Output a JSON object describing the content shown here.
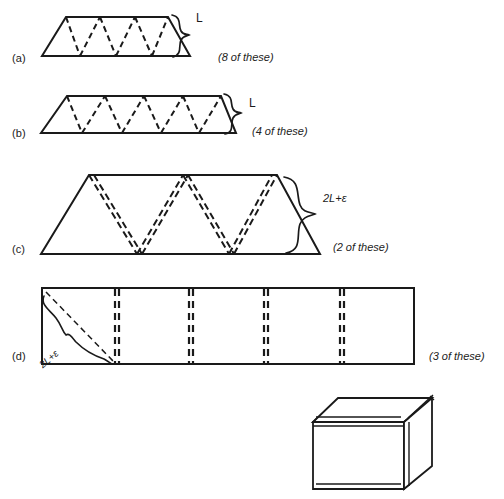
{
  "figure": {
    "background_color": "#ffffff",
    "stroke_color": "#1a1a1a",
    "panels": [
      {
        "id": "a",
        "label": "(a)",
        "shape": "trapezoid-with-zigzag",
        "dimension_label": "L",
        "count_label": "(8 of these)",
        "dash_style": "single",
        "peaks": 3,
        "valleys": 2
      },
      {
        "id": "b",
        "label": "(b)",
        "shape": "trapezoid-with-zigzag",
        "dimension_label": "L",
        "count_label": "(4 of these)",
        "dash_style": "single",
        "peaks": 4,
        "valleys": 3
      },
      {
        "id": "c",
        "label": "(c)",
        "shape": "trapezoid-with-zigzag",
        "dimension_label": "2L+ε",
        "count_label": "(2 of these)",
        "dash_style": "double",
        "peaks": 3,
        "valleys": 2
      },
      {
        "id": "d",
        "label": "(d)",
        "shape": "rectangle-with-creases",
        "dimension_label": "2L+ε",
        "count_label": "(3 of these)",
        "dash_style": "double",
        "crease_count": 4
      }
    ],
    "assembly": {
      "name": "cube",
      "description": "assembled cube drawn in perspective with doubled edges"
    }
  }
}
